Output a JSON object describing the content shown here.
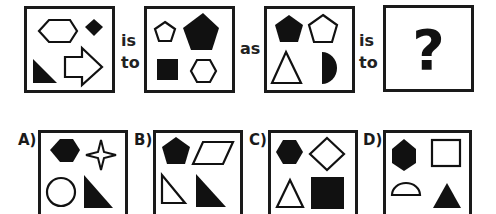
{
  "puzzle": {
    "analogy_words": {
      "is_to_1": [
        "is",
        "to"
      ],
      "as": "as",
      "is_to_2": [
        "is",
        "to"
      ]
    },
    "question_mark": "?",
    "panels": [
      {
        "id": "panel-1",
        "shapes": [
          {
            "shape": "hexagon",
            "fill": "outline",
            "position": "top-left"
          },
          {
            "shape": "diamond",
            "fill": "solid",
            "position": "top-right"
          },
          {
            "shape": "right-triangle",
            "fill": "solid",
            "position": "bottom-left"
          },
          {
            "shape": "arrow-right",
            "fill": "outline",
            "position": "bottom-right"
          }
        ]
      },
      {
        "id": "panel-2",
        "shapes": [
          {
            "shape": "pentagon",
            "fill": "outline",
            "position": "top-left"
          },
          {
            "shape": "pentagon",
            "fill": "solid",
            "position": "top-right"
          },
          {
            "shape": "square",
            "fill": "solid",
            "position": "bottom-left"
          },
          {
            "shape": "hexagon",
            "fill": "outline",
            "position": "bottom-right"
          }
        ]
      },
      {
        "id": "panel-3",
        "shapes": [
          {
            "shape": "pentagon",
            "fill": "solid",
            "position": "top-left"
          },
          {
            "shape": "pentagon",
            "fill": "outline",
            "position": "top-right"
          },
          {
            "shape": "triangle",
            "fill": "outline",
            "position": "bottom-left"
          },
          {
            "shape": "half-circle",
            "fill": "solid",
            "position": "bottom-right"
          }
        ]
      },
      {
        "id": "panel-4",
        "shapes": [],
        "content": "?"
      }
    ],
    "options": [
      {
        "label": "A)",
        "shapes": [
          {
            "shape": "hexagon",
            "fill": "solid",
            "position": "top-left"
          },
          {
            "shape": "four-point-star",
            "fill": "outline",
            "position": "top-right"
          },
          {
            "shape": "circle",
            "fill": "outline",
            "position": "bottom-left"
          },
          {
            "shape": "right-triangle",
            "fill": "solid",
            "position": "bottom-right"
          }
        ]
      },
      {
        "label": "B)",
        "shapes": [
          {
            "shape": "pentagon",
            "fill": "solid",
            "position": "top-left"
          },
          {
            "shape": "parallelogram",
            "fill": "outline",
            "position": "top-right"
          },
          {
            "shape": "right-triangle",
            "fill": "outline",
            "position": "bottom-left"
          },
          {
            "shape": "right-triangle",
            "fill": "solid",
            "position": "bottom-right"
          }
        ]
      },
      {
        "label": "C)",
        "shapes": [
          {
            "shape": "hexagon",
            "fill": "solid",
            "position": "top-left"
          },
          {
            "shape": "diamond",
            "fill": "outline",
            "position": "top-right"
          },
          {
            "shape": "triangle",
            "fill": "outline",
            "position": "bottom-left"
          },
          {
            "shape": "square",
            "fill": "solid",
            "position": "bottom-right"
          }
        ]
      },
      {
        "label": "D)",
        "shapes": [
          {
            "shape": "hexagon",
            "fill": "solid",
            "position": "top-left"
          },
          {
            "shape": "square",
            "fill": "outline",
            "position": "top-right"
          },
          {
            "shape": "half-circle",
            "fill": "outline",
            "position": "bottom-left"
          },
          {
            "shape": "triangle",
            "fill": "solid",
            "position": "bottom-right"
          }
        ]
      }
    ]
  },
  "colors": {
    "ink": "#111111",
    "border": "#1a1a1a",
    "background": "#ffffff"
  }
}
